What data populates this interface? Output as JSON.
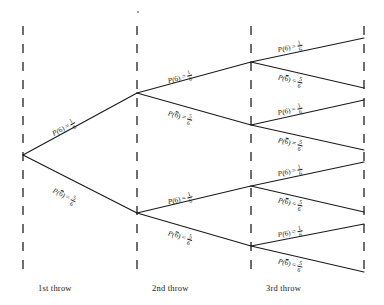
{
  "figure": {
    "type": "probability-tree",
    "background_color": "#ffffff",
    "line_color": "#1a1a1a",
    "dashed_color": "#555555"
  },
  "stages": [
    {
      "id": "stage-1",
      "caption": "1st throw",
      "axis_x": 23,
      "caption_x": 38,
      "caption_y": 283
    },
    {
      "id": "stage-2",
      "caption": "2nd throw",
      "axis_x": 137,
      "caption_x": 152,
      "caption_y": 283
    },
    {
      "id": "stage-3",
      "caption": "3rd throw",
      "axis_x": 251,
      "caption_x": 266,
      "caption_y": 283
    },
    {
      "id": "stage-end",
      "caption": "",
      "axis_x": 364,
      "caption_x": 0,
      "caption_y": 0
    }
  ],
  "outcomes": {
    "six": {
      "symbol": "P(6)",
      "prefix": "P",
      "event": "6",
      "overbar": false,
      "numerator": "1",
      "denominator": "6",
      "probability": 0.1667
    },
    "not_six": {
      "symbol": "P(6̄)",
      "prefix": "P",
      "event": "6",
      "overbar": true,
      "numerator": "5",
      "denominator": "6",
      "probability": 0.8333
    }
  },
  "equals_sign": "=",
  "nodes": [
    {
      "id": "root",
      "x": 23,
      "y": 155,
      "level": 0
    },
    {
      "id": "n-1",
      "x": 137,
      "y": 93,
      "level": 1
    },
    {
      "id": "n-2",
      "x": 137,
      "y": 213,
      "level": 1
    },
    {
      "id": "n-11",
      "x": 251,
      "y": 62,
      "level": 2
    },
    {
      "id": "n-12",
      "x": 251,
      "y": 125,
      "level": 2
    },
    {
      "id": "n-21",
      "x": 251,
      "y": 186,
      "level": 2
    },
    {
      "id": "n-22",
      "x": 251,
      "y": 246,
      "level": 2
    },
    {
      "id": "leaf-1",
      "x": 364,
      "y": 38,
      "level": 3
    },
    {
      "id": "leaf-2",
      "x": 364,
      "y": 88,
      "level": 3
    },
    {
      "id": "leaf-3",
      "x": 364,
      "y": 100,
      "level": 3
    },
    {
      "id": "leaf-4",
      "x": 364,
      "y": 150,
      "level": 3
    },
    {
      "id": "leaf-5",
      "x": 364,
      "y": 162,
      "level": 3
    },
    {
      "id": "leaf-6",
      "x": 364,
      "y": 212,
      "level": 3
    },
    {
      "id": "leaf-7",
      "x": 364,
      "y": 224,
      "level": 3
    },
    {
      "id": "leaf-8",
      "x": 364,
      "y": 272,
      "level": 3
    }
  ],
  "branches": [
    {
      "id": "b-1",
      "from": "root",
      "to": "n-1",
      "outcome": "six",
      "label_x": 53,
      "label_y": 128,
      "angle": -28.5
    },
    {
      "id": "b-2",
      "from": "root",
      "to": "n-2",
      "outcome": "not_six",
      "label_x": 53,
      "label_y": 184,
      "angle": 27.0
    },
    {
      "id": "b-3",
      "from": "n-1",
      "to": "n-11",
      "outcome": "six",
      "label_x": 168,
      "label_y": 75,
      "angle": -15.2
    },
    {
      "id": "b-4",
      "from": "n-1",
      "to": "n-12",
      "outcome": "not_six",
      "label_x": 168,
      "label_y": 107,
      "angle": 15.7
    },
    {
      "id": "b-5",
      "from": "n-2",
      "to": "n-21",
      "outcome": "six",
      "label_x": 168,
      "label_y": 196,
      "angle": -13.3
    },
    {
      "id": "b-6",
      "from": "n-2",
      "to": "n-22",
      "outcome": "not_six",
      "label_x": 168,
      "label_y": 227,
      "angle": 16.2
    },
    {
      "id": "b-7",
      "from": "n-11",
      "to": "leaf-1",
      "outcome": "six",
      "label_x": 278,
      "label_y": 44,
      "angle": -12.0
    },
    {
      "id": "b-8",
      "from": "n-11",
      "to": "leaf-2",
      "outcome": "not_six",
      "label_x": 278,
      "label_y": 71,
      "angle": 12.9
    },
    {
      "id": "b-9",
      "from": "n-12",
      "to": "leaf-3",
      "outcome": "six",
      "label_x": 278,
      "label_y": 107,
      "angle": -12.5
    },
    {
      "id": "b-10",
      "from": "n-12",
      "to": "leaf-4",
      "outcome": "not_six",
      "label_x": 278,
      "label_y": 134,
      "angle": 12.5
    },
    {
      "id": "b-11",
      "from": "n-21",
      "to": "leaf-5",
      "outcome": "six",
      "label_x": 278,
      "label_y": 168,
      "angle": -12.0
    },
    {
      "id": "b-12",
      "from": "n-21",
      "to": "leaf-6",
      "outcome": "not_six",
      "label_x": 278,
      "label_y": 194,
      "angle": 12.9
    },
    {
      "id": "b-13",
      "from": "n-22",
      "to": "leaf-7",
      "outcome": "six",
      "label_x": 278,
      "label_y": 229,
      "angle": -11.0
    },
    {
      "id": "b-14",
      "from": "n-22",
      "to": "leaf-8",
      "outcome": "not_six",
      "label_x": 278,
      "label_y": 255,
      "angle": 13.0
    }
  ],
  "axes": [
    {
      "id": "axis-1",
      "x": 23,
      "y1": 26,
      "y2": 271
    },
    {
      "id": "axis-2",
      "x": 137,
      "y1": 26,
      "y2": 271
    },
    {
      "id": "axis-3",
      "x": 251,
      "y1": 26,
      "y2": 271
    },
    {
      "id": "axis-4",
      "x": 364,
      "y1": 26,
      "y2": 271
    }
  ]
}
